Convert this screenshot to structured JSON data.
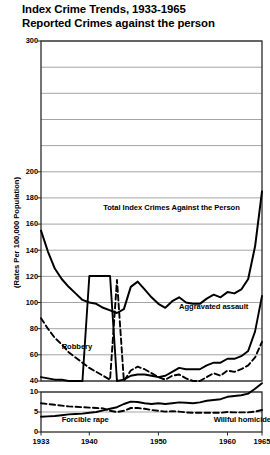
{
  "title": {
    "line1": "Index Crime Trends, 1933-1965",
    "line2": "Reported  Crimes against the person"
  },
  "axes": {
    "ylabel": "(Rates Per 100,000 Population)",
    "yticks_upper": [
      "300",
      "200",
      "180",
      "160",
      "140",
      "120",
      "100",
      "80",
      "60",
      "40"
    ],
    "yticks_lower": [
      "10",
      "5",
      "0"
    ],
    "xticks": [
      "1933",
      "1940",
      "1950",
      "1960",
      "1965"
    ]
  },
  "chart_data": {
    "type": "line",
    "title": "Index Crime Trends, 1933-1965 Reported Crimes against the person",
    "xlabel": "",
    "ylabel": "(Rates Per 100,000 Population)",
    "xlim": [
      1933,
      1965
    ],
    "ylim": [
      0,
      300
    ],
    "axis_break": {
      "between": [
        10,
        40
      ],
      "note": "y-axis broken; 0-10 band compressed below 40"
    },
    "grid": true,
    "legend": "inline-labels",
    "gridline_values": [
      300,
      280,
      260,
      240,
      220,
      200,
      180,
      160,
      140,
      120,
      100,
      80,
      60,
      40
    ],
    "x": [
      1933,
      1934,
      1935,
      1936,
      1937,
      1938,
      1939,
      1940,
      1941,
      1942,
      1943,
      1944,
      1945,
      1946,
      1947,
      1948,
      1949,
      1950,
      1951,
      1952,
      1953,
      1954,
      1955,
      1956,
      1957,
      1958,
      1959,
      1960,
      1961,
      1962,
      1963,
      1964,
      1965
    ],
    "series": [
      {
        "name": "Total Index Crimes Against the Person",
        "style": "solid",
        "values": [
          155,
          139,
          126,
          118,
          112,
          107,
          102,
          100,
          99,
          96,
          94,
          92,
          95,
          112,
          116,
          110,
          104,
          99,
          96,
          101,
          104,
          100,
          99,
          99,
          103,
          106,
          104,
          108,
          107,
          110,
          118,
          143,
          185
        ]
      },
      {
        "name": "Aggravated assault",
        "style": "solid",
        "values": [
          43,
          42,
          41,
          41,
          40,
          40,
          40,
          39,
          39,
          39,
          39,
          40,
          41,
          44,
          45,
          45,
          44,
          43,
          44,
          47,
          50,
          49,
          49,
          49,
          52,
          54,
          54,
          57,
          57,
          59,
          63,
          78,
          105
        ]
      },
      {
        "name": "Robbery",
        "style": "dashed",
        "values": [
          88,
          80,
          73,
          68,
          62,
          58,
          54,
          50,
          47,
          44,
          41,
          38,
          40,
          48,
          51,
          49,
          46,
          43,
          41,
          44,
          45,
          42,
          40,
          40,
          43,
          46,
          44,
          48,
          47,
          49,
          52,
          58,
          70
        ]
      },
      {
        "name": "Willful homicide",
        "style": "dashed",
        "values": [
          7.2,
          7.0,
          6.8,
          6.6,
          6.4,
          6.3,
          6.2,
          6.1,
          6.0,
          5.9,
          5.3,
          5.0,
          5.3,
          6.0,
          6.0,
          5.8,
          5.5,
          5.3,
          5.1,
          5.2,
          5.1,
          4.9,
          4.8,
          4.8,
          4.8,
          4.8,
          4.8,
          5.0,
          4.9,
          4.9,
          4.9,
          5.1,
          5.5
        ]
      },
      {
        "name": "Forcible rape",
        "style": "solid",
        "values": [
          3.8,
          3.9,
          4.0,
          4.2,
          4.4,
          4.5,
          4.6,
          4.8,
          5.0,
          5.4,
          5.8,
          6.2,
          7.0,
          7.6,
          7.5,
          7.2,
          7.0,
          7.2,
          7.0,
          7.2,
          7.4,
          7.3,
          7.2,
          7.4,
          7.8,
          8.0,
          8.2,
          8.8,
          9.0,
          9.2,
          9.6,
          10.8,
          12.2
        ]
      }
    ],
    "annotations": [
      {
        "text": "Total Index Crimes Against the Person",
        "x": 1942,
        "y": 172
      },
      {
        "text": "Aggravated assault",
        "x": 1953,
        "y": 97
      },
      {
        "text": "Robbery",
        "x": 1936,
        "y": 66
      },
      {
        "text": "Forcible rape",
        "x": 1936,
        "y": 3
      },
      {
        "text": "Willful homicide",
        "x": 1958,
        "y": 3
      }
    ]
  }
}
